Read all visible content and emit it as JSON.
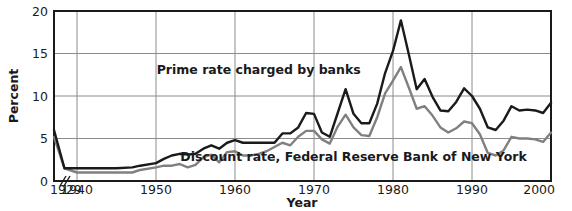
{
  "chart_data": {
    "type": "line",
    "title": "",
    "subtitle": "",
    "xlabel": "Year",
    "ylabel": "Percent",
    "xlim": [
      1929,
      2000
    ],
    "ylim": [
      0,
      20
    ],
    "grid": true,
    "axis_break": "//",
    "axis_break_note": "x-axis compressed between 1929 and 1940",
    "legend_position": "inline-annotations",
    "x_ticks": [
      "1929",
      "1940",
      "1950",
      "1960",
      "1970",
      "1980",
      "1990",
      "2000"
    ],
    "x_tick_values": [
      1929,
      1940,
      1950,
      1960,
      1970,
      1980,
      1990,
      2000
    ],
    "y_ticks": [
      "0",
      "5",
      "10",
      "15",
      "20"
    ],
    "y_tick_values": [
      0,
      5,
      10,
      15,
      20
    ],
    "colors": {
      "prime_rate": "#1a1a1a",
      "discount_rate": "#808080",
      "grid": "#8c8c8c",
      "frame": "#1a1a1a",
      "background": "#ffffff"
    },
    "annotations": [
      {
        "name": "prime-rate-label",
        "text": "Prime rate charged by banks",
        "x": 1963,
        "y": 12.6
      },
      {
        "name": "discount-rate-label",
        "text": "Discount rate, Federal Reserve Bank of New York",
        "x": 1975,
        "y": 2.3
      }
    ],
    "series": [
      {
        "name": "Prime rate charged by banks",
        "color": "#1a1a1a",
        "x": [
          1929,
          1934,
          1940,
          1945,
          1947,
          1948,
          1950,
          1951,
          1952,
          1953,
          1954,
          1955,
          1956,
          1957,
          1958,
          1959,
          1960,
          1961,
          1962,
          1963,
          1964,
          1965,
          1966,
          1967,
          1968,
          1969,
          1970,
          1971,
          1972,
          1973,
          1974,
          1975,
          1976,
          1977,
          1978,
          1979,
          1980,
          1981,
          1982,
          1983,
          1984,
          1985,
          1986,
          1987,
          1988,
          1989,
          1990,
          1991,
          1992,
          1993,
          1994,
          1995,
          1996,
          1997,
          1998,
          1999,
          2000
        ],
        "values": [
          6.0,
          1.5,
          1.5,
          1.5,
          1.6,
          1.8,
          2.1,
          2.6,
          3.0,
          3.2,
          3.1,
          3.2,
          3.8,
          4.2,
          3.8,
          4.5,
          4.8,
          4.5,
          4.5,
          4.5,
          4.5,
          4.5,
          5.6,
          5.6,
          6.3,
          8.0,
          7.9,
          5.7,
          5.2,
          8.0,
          10.8,
          7.9,
          6.8,
          6.8,
          9.1,
          12.7,
          15.3,
          18.9,
          14.9,
          10.8,
          12.0,
          9.9,
          8.3,
          8.2,
          9.3,
          10.9,
          10.0,
          8.5,
          6.3,
          6.0,
          7.1,
          8.8,
          8.3,
          8.4,
          8.3,
          8.0,
          9.2
        ]
      },
      {
        "name": "Discount rate, Federal Reserve Bank of New York",
        "color": "#808080",
        "x": [
          1929,
          1934,
          1940,
          1945,
          1947,
          1948,
          1950,
          1951,
          1952,
          1953,
          1954,
          1955,
          1956,
          1957,
          1958,
          1959,
          1960,
          1961,
          1962,
          1963,
          1964,
          1965,
          1966,
          1967,
          1968,
          1969,
          1970,
          1971,
          1972,
          1973,
          1974,
          1975,
          1976,
          1977,
          1978,
          1979,
          1980,
          1981,
          1982,
          1983,
          1984,
          1985,
          1986,
          1987,
          1988,
          1989,
          1990,
          1991,
          1992,
          1993,
          1994,
          1995,
          1996,
          1997,
          1998,
          1999,
          2000
        ],
        "values": [
          5.2,
          1.5,
          1.0,
          1.0,
          1.0,
          1.3,
          1.6,
          1.8,
          1.8,
          2.0,
          1.6,
          1.9,
          2.8,
          3.1,
          2.2,
          3.4,
          3.5,
          3.0,
          3.0,
          3.2,
          3.5,
          4.0,
          4.5,
          4.2,
          5.2,
          5.9,
          5.9,
          4.9,
          4.4,
          6.4,
          7.8,
          6.3,
          5.4,
          5.3,
          7.5,
          10.3,
          11.8,
          13.4,
          11.0,
          8.5,
          8.8,
          7.7,
          6.3,
          5.7,
          6.2,
          7.0,
          6.8,
          5.5,
          3.3,
          3.0,
          3.6,
          5.2,
          5.0,
          5.0,
          4.9,
          4.6,
          5.7
        ]
      }
    ]
  }
}
